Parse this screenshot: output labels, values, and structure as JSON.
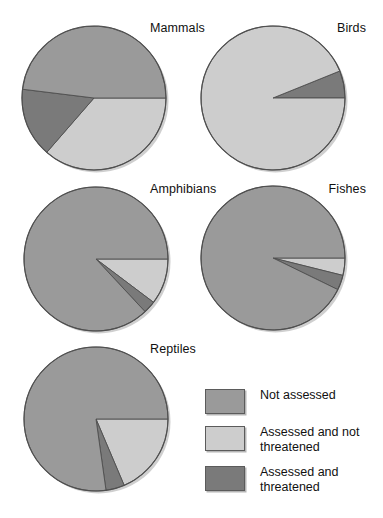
{
  "figure": {
    "title": "",
    "background": "#ffffff"
  },
  "colors": {
    "not_assessed": "#9a9a9a",
    "assessed_not_threatened": "#cdcdcd",
    "assessed_threatened": "#7a7a7a",
    "outline": "#4f4f4f",
    "shadow": "#b8b8b8",
    "text": "#111111"
  },
  "legend": {
    "name": "legend",
    "position": "bottom-right",
    "items": [
      {
        "label": "Not assessed",
        "color": "#9a9a9a",
        "key": "not_assessed"
      },
      {
        "label": "Assessed and not threatened",
        "color": "#cdcdcd",
        "key": "assessed_not_threatened"
      },
      {
        "label": "Assessed and threatened",
        "color": "#7a7a7a",
        "key": "assessed_threatened"
      }
    ]
  },
  "chart_data": {
    "type": "pie",
    "title": "",
    "legend_position": "bottom-right",
    "categories": [
      "Not assessed",
      "Assessed and not threatened",
      "Assessed and threatened"
    ],
    "category_colors": [
      "#9a9a9a",
      "#cdcdcd",
      "#7a7a7a"
    ],
    "panels": [
      {
        "label": "Mammals",
        "cx": 94,
        "cy": 98,
        "r": 72,
        "start_angle_deg": 0,
        "direction": "clockwise",
        "slices": [
          {
            "category": "Assessed and not threatened",
            "color": "#cdcdcd",
            "angle_deg": 131,
            "percent": 36.4
          },
          {
            "category": "Assessed and threatened",
            "color": "#7a7a7a",
            "angle_deg": 56,
            "percent": 15.6
          },
          {
            "category": "Not assessed",
            "color": "#9a9a9a",
            "angle_deg": 173,
            "percent": 48.0
          }
        ]
      },
      {
        "label": "Birds",
        "cx": 273,
        "cy": 98,
        "r": 72,
        "start_angle_deg": 0,
        "direction": "counterclockwise",
        "slices": [
          {
            "category": "Assessed and threatened",
            "color": "#7a7a7a",
            "angle_deg": 22,
            "percent": 6.1
          },
          {
            "category": "Assessed and not threatened",
            "color": "#cdcdcd",
            "angle_deg": 338,
            "percent": 93.9
          },
          {
            "category": "Not assessed",
            "color": "#9a9a9a",
            "angle_deg": 0,
            "percent": 0.0
          }
        ]
      },
      {
        "label": "Amphibians",
        "cx": 96,
        "cy": 259,
        "r": 72,
        "start_angle_deg": 0,
        "direction": "clockwise",
        "slices": [
          {
            "category": "Assessed and not threatened",
            "color": "#cdcdcd",
            "angle_deg": 37,
            "percent": 10.3
          },
          {
            "category": "Assessed and threatened",
            "color": "#7a7a7a",
            "angle_deg": 10,
            "percent": 2.8
          },
          {
            "category": "Not assessed",
            "color": "#9a9a9a",
            "angle_deg": 313,
            "percent": 86.9
          }
        ]
      },
      {
        "label": "Fishes",
        "cx": 273,
        "cy": 258,
        "r": 72,
        "start_angle_deg": 0,
        "direction": "clockwise",
        "slices": [
          {
            "category": "Assessed and not threatened",
            "color": "#cdcdcd",
            "angle_deg": 14,
            "percent": 3.9
          },
          {
            "category": "Assessed and threatened",
            "color": "#7a7a7a",
            "angle_deg": 12,
            "percent": 3.3
          },
          {
            "category": "Not assessed",
            "color": "#9a9a9a",
            "angle_deg": 334,
            "percent": 92.8
          }
        ]
      },
      {
        "label": "Reptiles",
        "cx": 96,
        "cy": 419,
        "r": 72,
        "start_angle_deg": 0,
        "direction": "clockwise",
        "slices": [
          {
            "category": "Assessed and not threatened",
            "color": "#cdcdcd",
            "angle_deg": 67,
            "percent": 18.6
          },
          {
            "category": "Assessed and threatened",
            "color": "#7a7a7a",
            "angle_deg": 15,
            "percent": 4.2
          },
          {
            "category": "Not assessed",
            "color": "#9a9a9a",
            "angle_deg": 278,
            "percent": 77.2
          }
        ]
      }
    ]
  },
  "labels": {
    "mammals": "Mammals",
    "birds": "Birds",
    "amphibians": "Amphibians",
    "fishes": "Fishes",
    "reptiles": "Reptiles"
  }
}
